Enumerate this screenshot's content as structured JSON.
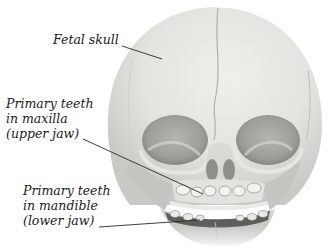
{
  "figure": {
    "labels": [
      {
        "id": "fetal-skull",
        "lines": [
          "Fetal skull"
        ]
      },
      {
        "id": "primary-teeth-maxilla",
        "lines": [
          "Primary teeth",
          "in maxilla",
          "(upper jaw)"
        ]
      },
      {
        "id": "primary-teeth-mandible",
        "lines": [
          "Primary teeth",
          "in mandible",
          "(lower jaw)"
        ]
      }
    ],
    "colors": {
      "background": "#ffffff",
      "bone_light": "#e9e9e6",
      "bone_mid": "#cfcfcb",
      "bone_shadow": "#8f8f8c",
      "label_text": "#1a1a1a",
      "leader_line": "#2a2a2a"
    }
  }
}
